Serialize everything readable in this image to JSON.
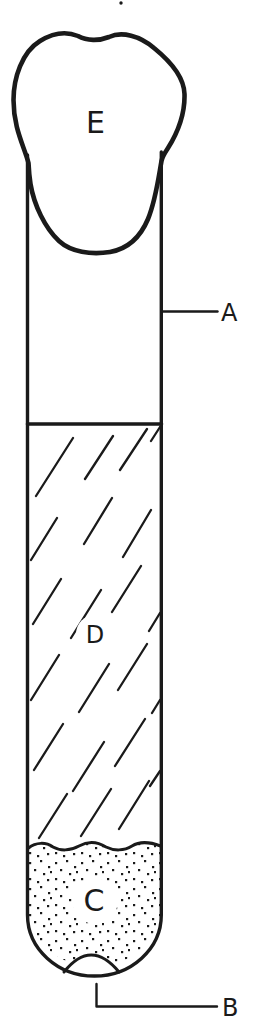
{
  "diagram": {
    "labels": {
      "plug": "E",
      "tube": "A",
      "medium": "D",
      "sediment": "C",
      "bottom": "B"
    },
    "colors": {
      "ink": "#1a1a1a",
      "paper": "#ffffff"
    }
  }
}
